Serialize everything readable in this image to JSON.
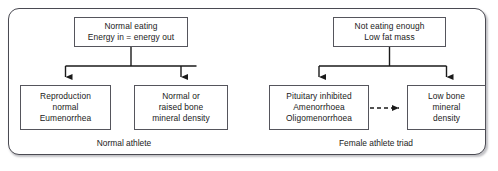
{
  "diagram": {
    "colors": {
      "panel_border": "#4a4a52",
      "box_border": "#55555c",
      "connector": "#1a1a1a",
      "text": "#1a1a1a",
      "background": "#ffffff"
    }
  },
  "clusters": [
    {
      "id": "normal-athlete",
      "caption": "Normal athlete",
      "root": {
        "id": "normal-eating",
        "lines": [
          "Normal eating",
          "Energy in = energy out"
        ]
      },
      "children": [
        {
          "id": "reproduction",
          "lines": [
            "Reproduction",
            "normal",
            "Eumenorrhea"
          ]
        },
        {
          "id": "bone-density",
          "lines": [
            "Normal or",
            "raised bone",
            "mineral density"
          ]
        }
      ]
    },
    {
      "id": "female-athlete-triad",
      "caption": "Female athlete triad",
      "root": {
        "id": "not-eating-enough",
        "lines": [
          "Not eating enough",
          "Low fat mass"
        ]
      },
      "children": [
        {
          "id": "pituitary-inhibited",
          "lines": [
            "Pituitary inhibited",
            "Amenorrhoea",
            "Oligomenorrhoea"
          ]
        },
        {
          "id": "low-bone-mineral-density",
          "lines": [
            "Low bone",
            "mineral",
            "density"
          ]
        }
      ]
    }
  ],
  "connectors": {
    "left_branch": "solid-split-arrow",
    "right_branch": "solid-split-arrow",
    "pituitary_to_low_bone": "dashed-arrow-right"
  }
}
